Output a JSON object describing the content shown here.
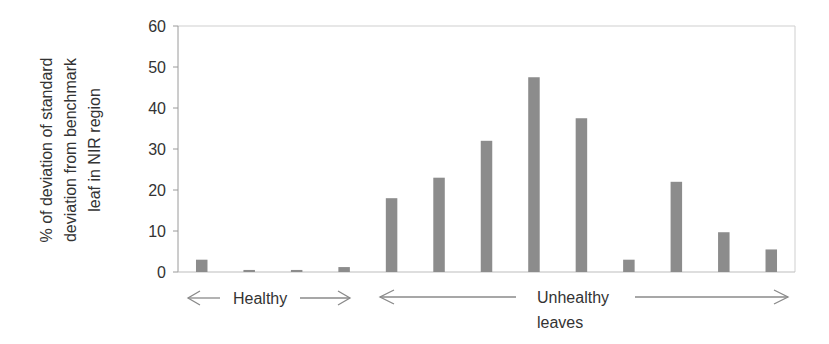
{
  "chart_data": {
    "type": "bar",
    "title": "",
    "xlabel": "",
    "ylabel": "% of deviation of standard deviation from benchmark leaf in NIR region",
    "ylabel_lines": [
      "% of deviation of standard",
      "deviation from benchmark",
      "leaf in NIR region"
    ],
    "ylim": [
      0,
      60
    ],
    "yticks": [
      0,
      10,
      20,
      30,
      40,
      50,
      60
    ],
    "grid": false,
    "legend": null,
    "categories": [
      "1",
      "2",
      "3",
      "4",
      "5",
      "6",
      "7",
      "8",
      "9",
      "10",
      "11",
      "12",
      "13"
    ],
    "values": [
      3.0,
      0.5,
      0.5,
      1.2,
      18.0,
      23.0,
      32.0,
      47.5,
      37.5,
      3.0,
      22.0,
      9.7,
      5.5
    ],
    "bar_color": "#8c8c8c",
    "annotations": [
      {
        "text": "Healthy",
        "spans_categories": [
          1,
          4
        ],
        "arrow": "double"
      },
      {
        "text": "Unhealthy",
        "text2": "leaves",
        "spans_categories": [
          5,
          13
        ],
        "arrow": "double"
      }
    ]
  },
  "annotations": {
    "healthy": "Healthy",
    "unhealthy_line1": "Unhealthy",
    "unhealthy_line2": "leaves"
  },
  "axis": {
    "ylabel_1": "% of deviation of standard",
    "ylabel_2": "deviation from benchmark",
    "ylabel_3": "leaf in NIR region"
  }
}
